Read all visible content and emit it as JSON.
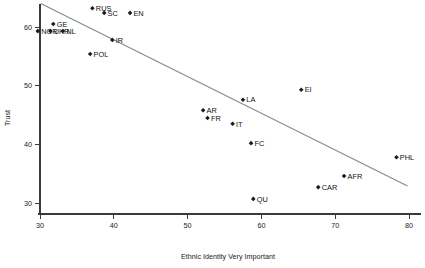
{
  "chart_data": {
    "type": "scatter",
    "title": "",
    "xlabel": "Ethnic Identity Very Important",
    "ylabel": "Trust",
    "xlim": [
      26.5,
      82.5
    ],
    "ylim": [
      27.5,
      65.5
    ],
    "xticks": [
      30,
      40,
      50,
      60,
      70,
      80
    ],
    "yticks": [
      30,
      40,
      50,
      60
    ],
    "grid": false,
    "legend": null,
    "marker_style": "small filled diamond with label to the right",
    "points": [
      {
        "label": "RUS",
        "x": 37.1,
        "y": 63.2
      },
      {
        "label": "SC",
        "x": 38.7,
        "y": 62.4
      },
      {
        "label": "EN",
        "x": 42.2,
        "y": 62.4
      },
      {
        "label": "GE",
        "x": 31.8,
        "y": 60.5
      },
      {
        "label": "NOR",
        "x": 29.7,
        "y": 59.3
      },
      {
        "label": "UKR",
        "x": 31.4,
        "y": 59.3
      },
      {
        "label": "NL",
        "x": 33.1,
        "y": 59.3
      },
      {
        "label": "IR",
        "x": 39.8,
        "y": 57.8
      },
      {
        "label": "POL",
        "x": 36.8,
        "y": 55.4
      },
      {
        "label": "EI",
        "x": 65.4,
        "y": 49.3
      },
      {
        "label": "LA",
        "x": 57.5,
        "y": 47.6
      },
      {
        "label": "AR",
        "x": 52.1,
        "y": 45.8
      },
      {
        "label": "FR",
        "x": 52.7,
        "y": 44.5
      },
      {
        "label": "IT",
        "x": 56.1,
        "y": 43.5
      },
      {
        "label": "FC",
        "x": 58.6,
        "y": 40.2
      },
      {
        "label": "PHL",
        "x": 78.3,
        "y": 37.8
      },
      {
        "label": "AFR",
        "x": 71.2,
        "y": 34.6
      },
      {
        "label": "CAR",
        "x": 67.7,
        "y": 32.7
      },
      {
        "label": "QU",
        "x": 58.9,
        "y": 30.7
      }
    ],
    "trend_line": {
      "type": "linear-fit",
      "x_start": 30.1,
      "y_start": 64.0,
      "x_end": 79.8,
      "y_end": 32.9,
      "color": "#8a8a8a"
    }
  },
  "colors": {
    "marker": "#1a1a1a",
    "axis": "#3a3a3a",
    "trend": "#8a8a8a",
    "text": "#111111",
    "background": "#ffffff"
  }
}
